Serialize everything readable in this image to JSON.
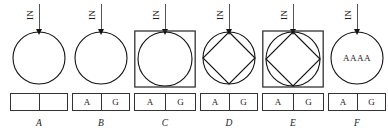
{
  "figure": {
    "arrow_label": "IN",
    "panels": [
      {
        "id": "A",
        "caption": "A",
        "shapes": "circle",
        "inner_text": "",
        "cells": [
          "",
          ""
        ],
        "left": 8,
        "width": 62,
        "box_width": 58,
        "circle_d": 52,
        "square_w": 0
      },
      {
        "id": "B",
        "caption": "B",
        "shapes": "circle",
        "inner_text": "",
        "cells": [
          "A",
          "G"
        ],
        "left": 70,
        "width": 62,
        "box_width": 58,
        "circle_d": 52,
        "square_w": 0
      },
      {
        "id": "C",
        "caption": "C",
        "shapes": "circle-in-square",
        "inner_text": "",
        "cells": [
          "A",
          "G"
        ],
        "left": 132,
        "width": 66,
        "box_width": 62,
        "circle_d": 54,
        "square_w": 62
      },
      {
        "id": "D",
        "caption": "D",
        "shapes": "diamond-in-circle",
        "inner_text": "",
        "cells": [
          "A",
          "G"
        ],
        "left": 198,
        "width": 62,
        "box_width": 58,
        "circle_d": 52,
        "square_w": 0
      },
      {
        "id": "E",
        "caption": "E",
        "shapes": "diamond-in-circle-in-square",
        "inner_text": "",
        "cells": [
          "A",
          "G"
        ],
        "left": 260,
        "width": 66,
        "box_width": 62,
        "circle_d": 54,
        "square_w": 62
      },
      {
        "id": "F",
        "caption": "F",
        "shapes": "circle",
        "inner_text": "AAAA",
        "cells": [
          "A",
          "G"
        ],
        "left": 326,
        "width": 62,
        "box_width": 58,
        "circle_d": 52,
        "square_w": 0
      }
    ]
  },
  "colors": {
    "stroke": "#111111",
    "square_stroke": "#333333",
    "arrow_line": "#555555",
    "background": "#ffffff"
  }
}
